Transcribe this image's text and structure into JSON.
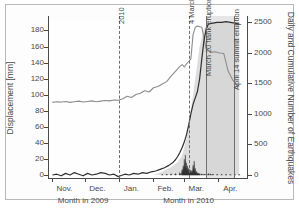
{
  "figure": {
    "caption": ""
  },
  "axes": {
    "left": {
      "title": "Displacement [mm]",
      "ticks": [
        0,
        20,
        40,
        60,
        80,
        100,
        120,
        140,
        160,
        180
      ],
      "min": 0,
      "max": 193
    },
    "right": {
      "title": "Daily and Cumulative Number of Earthquakes",
      "ticks": [
        0,
        500,
        1000,
        1500,
        2000,
        2500
      ],
      "min": 0,
      "max": 2540
    },
    "x": {
      "tick_labels": [
        "Nov.",
        "Dec.",
        "Jan.",
        "Feb.",
        "Mar.",
        "Apr."
      ],
      "sub_labels": [
        "Month in 2009",
        "Month in 2010"
      ]
    }
  },
  "annotations": [
    {
      "name": "year-2010",
      "label": "2010",
      "style": "dashed"
    },
    {
      "name": "four-march",
      "label": "4 March",
      "style": "dashed"
    },
    {
      "name": "march-20-flank",
      "label": "March 20 flank eruption",
      "style": "solid"
    },
    {
      "name": "april-14-summit",
      "label": "April 14 summit eruption",
      "style": "solid"
    }
  ],
  "colors": {
    "displacement_line": "#2f2f2f",
    "cumulative_line": "#8d8d8d",
    "daily_spikes": "#3a3a3a",
    "shaded_area": "#c9c9c9",
    "shaded_band": "#969696",
    "axis": "#4a4a4a",
    "frame": "#b9b9b9"
  },
  "chart_data": {
    "type": "line",
    "title": "",
    "xlabel": "Month in 2009 / Month in 2010",
    "ylabel": "Displacement [mm]",
    "ylabel_right": "Daily and Cumulative Number of Earthquakes",
    "ylim": [
      0,
      193
    ],
    "ylim_right": [
      0,
      2540
    ],
    "grid": false,
    "legend": "none",
    "x_tick_labels": [
      "Nov.",
      "Dec.",
      "Jan.",
      "Feb.",
      "Mar.",
      "Apr."
    ],
    "x_days_from_nov1": [
      0,
      30,
      61,
      92,
      120,
      151
    ],
    "series": [
      {
        "name": "Displacement [mm]",
        "axis": "left",
        "color": "#2f2f2f",
        "x_days": [
          0,
          4,
          8,
          12,
          16,
          20,
          24,
          28,
          32,
          36,
          40,
          44,
          48,
          52,
          56,
          60,
          62,
          66,
          70,
          74,
          78,
          82,
          86,
          90,
          94,
          98,
          102,
          106,
          110,
          112,
          114,
          116,
          118,
          120,
          122,
          124,
          126,
          128,
          130,
          132,
          134,
          136,
          138,
          140,
          142,
          146,
          150,
          154,
          158,
          162,
          166,
          170
        ],
        "values": [
          0,
          1,
          -1,
          2,
          0,
          3,
          1,
          -1,
          2,
          0,
          1,
          3,
          2,
          0,
          1,
          -2,
          -1,
          1,
          0,
          2,
          1,
          3,
          2,
          4,
          5,
          7,
          9,
          12,
          16,
          19,
          23,
          28,
          34,
          41,
          50,
          62,
          76,
          88,
          96,
          104,
          120,
          145,
          168,
          182,
          188,
          189,
          190,
          190,
          191,
          190,
          189,
          188
        ]
      },
      {
        "name": "Cumulative Number of Earthquakes",
        "axis": "right",
        "color": "#8d8d8d",
        "x_days": [
          0,
          4,
          8,
          12,
          16,
          20,
          24,
          28,
          32,
          36,
          40,
          44,
          48,
          52,
          56,
          60,
          64,
          68,
          72,
          76,
          80,
          84,
          88,
          92,
          96,
          100,
          104,
          108,
          112,
          116,
          118,
          120,
          122,
          124,
          126,
          128,
          130,
          132,
          134,
          136,
          140,
          144,
          148,
          152,
          156,
          160,
          164,
          168,
          170
        ],
        "values": [
          1190,
          1200,
          1195,
          1205,
          1190,
          1200,
          1210,
          1195,
          1205,
          1215,
          1200,
          1210,
          1220,
          1215,
          1230,
          1225,
          1250,
          1290,
          1270,
          1320,
          1340,
          1380,
          1360,
          1430,
          1450,
          1490,
          1530,
          1620,
          1700,
          1780,
          1810,
          1770,
          1820,
          1860,
          1900,
          2300,
          2420,
          2440,
          2430,
          2420,
          2060,
          2010,
          2020,
          2000,
          1990,
          1700,
          1560,
          1470,
          1450
        ]
      },
      {
        "name": "Daily Number of Earthquakes",
        "axis": "right",
        "color": "#3a3a3a",
        "type": "spikes",
        "x_days": [
          100,
          104,
          108,
          112,
          116,
          118,
          119,
          120,
          121,
          122,
          123,
          124,
          125,
          126,
          127,
          128,
          129,
          130,
          131,
          132,
          133,
          134,
          136,
          138,
          140,
          142,
          144,
          146,
          150,
          154,
          158,
          162,
          166,
          170
        ],
        "values": [
          10,
          15,
          20,
          25,
          40,
          90,
          150,
          260,
          330,
          200,
          150,
          110,
          95,
          80,
          70,
          160,
          230,
          110,
          60,
          40,
          30,
          25,
          20,
          15,
          20,
          25,
          20,
          15,
          12,
          10,
          10,
          8,
          10,
          8
        ]
      },
      {
        "name": "Shaded Displacement Envelope",
        "axis": "left",
        "color": "#c9c9c9",
        "type": "area",
        "x_days": [
          92,
          100,
          108,
          114,
          118,
          122,
          126,
          130,
          134,
          138,
          142,
          150,
          160,
          170
        ],
        "values": [
          0,
          4,
          10,
          16,
          24,
          45,
          80,
          120,
          160,
          182,
          190,
          191,
          190,
          188
        ]
      }
    ],
    "event_markers": [
      {
        "label": "2010",
        "x_days": 61,
        "style": "dashed"
      },
      {
        "label": "4 March",
        "x_days": 124,
        "style": "dashed"
      },
      {
        "label": "March 20 flank eruption",
        "x_days": 140,
        "style": "solid"
      },
      {
        "label": "April 14 summit eruption",
        "x_days": 165,
        "style": "solid"
      }
    ],
    "shaded_band": {
      "from_days": 140,
      "to_days": 165
    }
  }
}
